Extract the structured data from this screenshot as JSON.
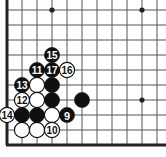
{
  "figure": {
    "kind": "go-board-diagram",
    "width": 166,
    "height": 157,
    "background_color": "#ffffff"
  },
  "board": {
    "line_color": "#555555",
    "edge_color": "#222222",
    "line_width": 1,
    "edge_width": 3,
    "spacing": 15,
    "origin_x": 7,
    "origin_y": 10,
    "cols": 11,
    "rows": 10,
    "edges": [
      "left",
      "bottom"
    ],
    "star_points": [
      {
        "x": 52,
        "y": 10
      },
      {
        "x": 142,
        "y": 10
      },
      {
        "x": 142,
        "y": 100
      }
    ]
  },
  "colors": {
    "black_stone": "#101010",
    "white_stone": "#ffffff",
    "stone_outline": "#101010",
    "black_label": "#ffffff",
    "white_label": "#101010"
  },
  "stones": [
    {
      "id": "stone-15",
      "color": "black",
      "label": "15",
      "x": 52,
      "y": 55
    },
    {
      "id": "stone-11",
      "color": "black",
      "label": "11",
      "x": 37,
      "y": 70
    },
    {
      "id": "stone-17",
      "color": "black",
      "label": "17",
      "x": 52,
      "y": 70
    },
    {
      "id": "stone-16",
      "color": "white",
      "label": "16",
      "x": 67,
      "y": 70
    },
    {
      "id": "stone-13",
      "color": "black",
      "label": "13",
      "x": 22,
      "y": 85
    },
    {
      "id": "stone-w-37-85",
      "color": "white",
      "label": "",
      "x": 37,
      "y": 85
    },
    {
      "id": "stone-b-52-85",
      "color": "black",
      "label": "",
      "x": 52,
      "y": 85
    },
    {
      "id": "stone-12",
      "color": "white",
      "label": "12",
      "x": 22,
      "y": 100
    },
    {
      "id": "stone-w-37-100",
      "color": "white",
      "label": "",
      "x": 37,
      "y": 100
    },
    {
      "id": "stone-b-52-100",
      "color": "black",
      "label": "",
      "x": 52,
      "y": 100
    },
    {
      "id": "stone-b-82-100",
      "color": "black",
      "label": "",
      "x": 82,
      "y": 100
    },
    {
      "id": "stone-14",
      "color": "white",
      "label": "14",
      "x": 7,
      "y": 115
    },
    {
      "id": "stone-b-22-115",
      "color": "black",
      "label": "",
      "x": 22,
      "y": 115
    },
    {
      "id": "stone-b-37-115",
      "color": "black",
      "label": "",
      "x": 37,
      "y": 115
    },
    {
      "id": "stone-w-52-115",
      "color": "white",
      "label": "",
      "x": 52,
      "y": 115
    },
    {
      "id": "stone-9",
      "color": "black",
      "label": "9",
      "x": 67,
      "y": 115
    },
    {
      "id": "stone-w-22-130",
      "color": "white",
      "label": "",
      "x": 22,
      "y": 130
    },
    {
      "id": "stone-w-37-130",
      "color": "white",
      "label": "",
      "x": 37,
      "y": 130
    },
    {
      "id": "stone-10",
      "color": "white",
      "label": "10",
      "x": 52,
      "y": 130
    }
  ]
}
